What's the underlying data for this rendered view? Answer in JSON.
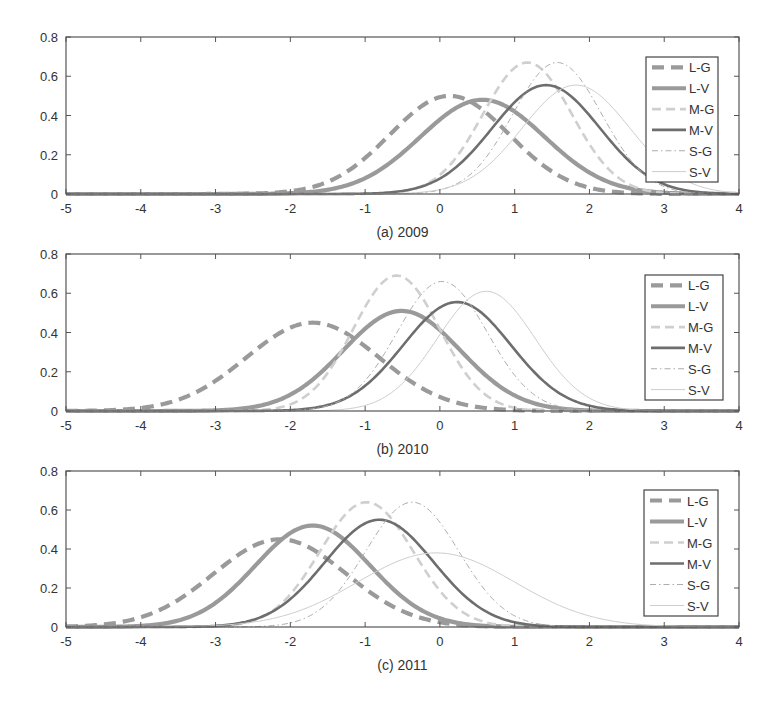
{
  "figure": {
    "panels_count": 3
  },
  "style": {
    "series": {
      "L-G": {
        "color": "#9a9a9a",
        "width": 4.2,
        "dash": "12,7"
      },
      "L-V": {
        "color": "#9a9a9a",
        "width": 4.2,
        "dash": ""
      },
      "M-G": {
        "color": "#cfcfcf",
        "width": 2.6,
        "dash": "9,5"
      },
      "M-V": {
        "color": "#6e6e6e",
        "width": 2.6,
        "dash": ""
      },
      "S-G": {
        "color": "#adadad",
        "width": 1.0,
        "dash": "6,3,1.5,3"
      },
      "S-V": {
        "color": "#cdcdcd",
        "width": 1.0,
        "dash": ""
      }
    },
    "axis_color": "#555555"
  },
  "chart_data": [
    {
      "type": "line",
      "title": "(a) 2009",
      "xlabel": "",
      "ylabel": "",
      "xlim": [
        -5,
        4
      ],
      "ylim": [
        0,
        0.8
      ],
      "xticks": [
        -5,
        -4,
        -3,
        -2,
        -1,
        0,
        1,
        2,
        3,
        4
      ],
      "yticks": [
        0,
        0.2,
        0.4,
        0.6,
        0.8
      ],
      "grid": false,
      "legend_position": "upper right",
      "legend": [
        "L-G",
        "L-V",
        "M-G",
        "M-V",
        "S-G",
        "S-V"
      ],
      "series": [
        {
          "name": "L-G",
          "distribution": "normal",
          "peak_x": 0.13,
          "peak_y": 0.5
        },
        {
          "name": "L-V",
          "distribution": "normal",
          "peak_x": 0.57,
          "peak_y": 0.48
        },
        {
          "name": "M-G",
          "distribution": "normal",
          "peak_x": 1.17,
          "peak_y": 0.67
        },
        {
          "name": "M-V",
          "distribution": "normal",
          "peak_x": 1.42,
          "peak_y": 0.555
        },
        {
          "name": "S-G",
          "distribution": "normal",
          "peak_x": 1.57,
          "peak_y": 0.67
        },
        {
          "name": "S-V",
          "distribution": "normal",
          "peak_x": 1.82,
          "peak_y": 0.555
        }
      ]
    },
    {
      "type": "line",
      "title": "(b) 2010",
      "xlabel": "",
      "ylabel": "",
      "xlim": [
        -5,
        4
      ],
      "ylim": [
        0,
        0.8
      ],
      "xticks": [
        -5,
        -4,
        -3,
        -2,
        -1,
        0,
        1,
        2,
        3,
        4
      ],
      "yticks": [
        0,
        0.2,
        0.4,
        0.6,
        0.8
      ],
      "grid": false,
      "legend_position": "upper right",
      "legend": [
        "L-G",
        "L-V",
        "M-G",
        "M-V",
        "S-G",
        "S-V"
      ],
      "series": [
        {
          "name": "L-G",
          "distribution": "normal",
          "peak_x": -1.7,
          "peak_y": 0.45
        },
        {
          "name": "L-V",
          "distribution": "normal",
          "peak_x": -0.51,
          "peak_y": 0.51
        },
        {
          "name": "M-G",
          "distribution": "normal",
          "peak_x": -0.58,
          "peak_y": 0.69
        },
        {
          "name": "M-V",
          "distribution": "normal",
          "peak_x": 0.23,
          "peak_y": 0.555
        },
        {
          "name": "S-G",
          "distribution": "normal",
          "peak_x": 0.03,
          "peak_y": 0.66
        },
        {
          "name": "S-V",
          "distribution": "normal",
          "peak_x": 0.62,
          "peak_y": 0.61
        }
      ]
    },
    {
      "type": "line",
      "title": "(c) 2011",
      "xlabel": "",
      "ylabel": "",
      "xlim": [
        -5,
        4
      ],
      "ylim": [
        0,
        0.8
      ],
      "xticks": [
        -5,
        -4,
        -3,
        -2,
        -1,
        0,
        1,
        2,
        3,
        4
      ],
      "yticks": [
        0,
        0.2,
        0.4,
        0.6,
        0.8
      ],
      "grid": false,
      "legend_position": "upper right",
      "legend": [
        "L-G",
        "L-V",
        "M-G",
        "M-V",
        "S-G",
        "S-V"
      ],
      "series": [
        {
          "name": "L-G",
          "distribution": "normal",
          "peak_x": -2.14,
          "peak_y": 0.45
        },
        {
          "name": "L-V",
          "distribution": "normal",
          "peak_x": -1.7,
          "peak_y": 0.52
        },
        {
          "name": "M-G",
          "distribution": "normal",
          "peak_x": -0.98,
          "peak_y": 0.64
        },
        {
          "name": "M-V",
          "distribution": "normal",
          "peak_x": -0.81,
          "peak_y": 0.55
        },
        {
          "name": "S-G",
          "distribution": "normal",
          "peak_x": -0.37,
          "peak_y": 0.64
        },
        {
          "name": "S-V",
          "distribution": "normal",
          "peak_x": -0.05,
          "peak_y": 0.38
        }
      ]
    }
  ],
  "layout": {
    "panels": [
      {
        "left": 66,
        "right": 739,
        "top": 37,
        "bottom": 194,
        "legend": {
          "x": 646,
          "y": 57,
          "w": 72,
          "h": 125
        }
      },
      {
        "left": 66,
        "right": 739,
        "top": 254,
        "bottom": 411,
        "legend": {
          "x": 645,
          "y": 275,
          "w": 78,
          "h": 125
        }
      },
      {
        "left": 66,
        "right": 739,
        "top": 471,
        "bottom": 627,
        "legend": {
          "x": 644,
          "y": 490,
          "w": 74,
          "h": 126
        }
      }
    ]
  }
}
